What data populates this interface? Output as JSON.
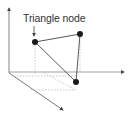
{
  "diagram": {
    "label": "Triangle node",
    "colors": {
      "axis": "#555555",
      "edge": "#444444",
      "node": "#1a1a1a",
      "guide": "#aaaaaa"
    },
    "nodes": [
      {
        "id": "n1",
        "x": 35,
        "y": 42,
        "labeled": true
      },
      {
        "id": "n2",
        "x": 80,
        "y": 34
      },
      {
        "id": "n3",
        "x": 76,
        "y": 82
      }
    ],
    "axes": [
      "vertical",
      "horizontal",
      "depth"
    ]
  }
}
